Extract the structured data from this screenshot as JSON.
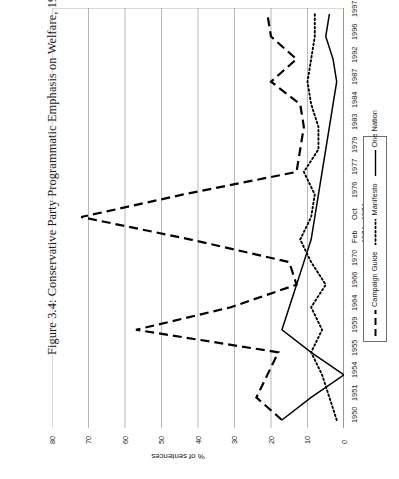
{
  "figure": {
    "title": "Figure 3.4: Conservative Party Programmatic Emphasis on Welfare, 1950–1997"
  },
  "legend": {
    "entries": [
      {
        "label": "Campaign Guide",
        "style": "dashed",
        "color": "#000000"
      },
      {
        "label": "Manifesto",
        "style": "dotted",
        "color": "#000000"
      },
      {
        "label": "One Nation",
        "style": "solid",
        "color": "#000000"
      }
    ]
  },
  "axes": {
    "value_axis_title": "% of sentences",
    "value_ticks": [
      "0",
      "10",
      "20",
      "30",
      "40",
      "50",
      "60",
      "70",
      "80"
    ],
    "category_ticks": [
      "1950",
      "1951",
      "1954",
      "1955",
      "1959",
      "1964",
      "1966",
      "1970",
      "Feb",
      "Oct",
      "1976",
      "1977",
      "1979",
      "1983",
      "1984",
      "1987",
      "1992",
      "1996",
      "1997"
    ],
    "category_sublabels": {
      "Feb": "1974",
      "Oct": "1974"
    }
  },
  "chart_data": {
    "type": "line",
    "title": "Figure 3.4: Conservative Party Programmatic Emphasis on Welfare, 1950–1997",
    "xlabel": "",
    "ylabel": "% of sentences",
    "ylim": [
      0,
      80
    ],
    "grid": true,
    "orientation": "rotated-90-ccw",
    "legend_position": "right",
    "categories": [
      "1950",
      "1951",
      "1954",
      "1955",
      "1959",
      "1964",
      "1966",
      "1970",
      "Feb 1974",
      "Oct 1974",
      "1976",
      "1977",
      "1979",
      "1983",
      "1984",
      "1987",
      "1992",
      "1996",
      "1997"
    ],
    "series": [
      {
        "name": "Campaign Guide",
        "style": "dashed",
        "values": [
          17,
          24,
          21,
          18,
          57,
          31,
          13,
          15,
          42,
          72,
          44,
          13,
          12,
          11,
          12,
          20,
          13,
          20,
          21
        ]
      },
      {
        "name": "Manifesto",
        "style": "dotted",
        "values": [
          2,
          4,
          6,
          9,
          6,
          9,
          5,
          9,
          12,
          9,
          8,
          11,
          7,
          7,
          9,
          10,
          9,
          8,
          8
        ]
      },
      {
        "name": "One Nation",
        "style": "solid",
        "values": [
          17,
          9,
          0,
          9,
          17,
          15,
          13,
          11,
          9,
          8,
          7,
          6,
          5,
          4,
          3,
          2,
          3,
          5,
          4
        ]
      }
    ]
  }
}
